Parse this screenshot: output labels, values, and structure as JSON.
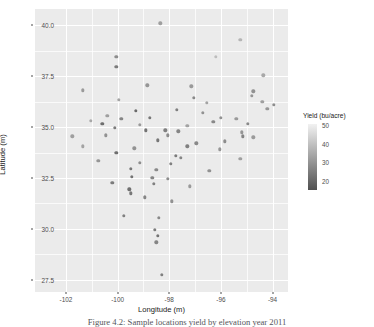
{
  "chart_data": {
    "type": "scatter",
    "title": "",
    "xlabel": "Longitude (m)",
    "ylabel": "Latitude (m)",
    "xlim": [
      -103.2,
      -93.4
    ],
    "ylim": [
      26.9,
      40.8
    ],
    "xticks": [
      -102,
      -100,
      -98,
      -96,
      -94
    ],
    "xtick_labels": [
      "-102",
      "-100",
      "-98",
      "-96",
      "-94"
    ],
    "yticks": [
      27.5,
      30.0,
      32.5,
      35.0,
      37.5,
      40.0
    ],
    "ytick_labels": [
      "27.5",
      "30.0",
      "32.5",
      "35.0",
      "37.5",
      "40.0"
    ],
    "x_minor_ticks": [
      -101,
      -99,
      -97,
      -95
    ],
    "y_minor_ticks": [
      28.75,
      31.25,
      33.75,
      36.25,
      38.75
    ],
    "grid": true,
    "panel_background": "#ebebeb",
    "grid_color": "#ffffff",
    "legend": {
      "title": "Yield (bu/acre)",
      "position": "right",
      "type": "continuous-colorbar",
      "ticks": [
        50,
        40,
        30,
        20
      ],
      "tick_labels": [
        "50",
        "40",
        "30",
        "20"
      ],
      "range": [
        15,
        52
      ],
      "color_low": "#505050",
      "color_high": "#f2f2f2"
    },
    "color_variable": "Yield (bu/acre)",
    "points": [
      {
        "x": -98.35,
        "y": 40.1,
        "v": 33
      },
      {
        "x": -95.25,
        "y": 39.3,
        "v": 38
      },
      {
        "x": -100.05,
        "y": 38.45,
        "v": 29
      },
      {
        "x": -96.2,
        "y": 38.45,
        "v": 40
      },
      {
        "x": -100.05,
        "y": 37.95,
        "v": 25
      },
      {
        "x": -94.35,
        "y": 37.55,
        "v": 35
      },
      {
        "x": -98.85,
        "y": 37.05,
        "v": 31
      },
      {
        "x": -97.15,
        "y": 37.0,
        "v": 32
      },
      {
        "x": -101.35,
        "y": 36.8,
        "v": 32
      },
      {
        "x": -94.75,
        "y": 36.75,
        "v": 30
      },
      {
        "x": -94.8,
        "y": 36.55,
        "v": 31
      },
      {
        "x": -97.05,
        "y": 36.45,
        "v": 28
      },
      {
        "x": -99.95,
        "y": 36.35,
        "v": 34
      },
      {
        "x": -94.4,
        "y": 36.25,
        "v": 33
      },
      {
        "x": -93.95,
        "y": 36.1,
        "v": 29
      },
      {
        "x": -94.2,
        "y": 35.9,
        "v": 31
      },
      {
        "x": -97.7,
        "y": 35.85,
        "v": 26
      },
      {
        "x": -99.3,
        "y": 35.8,
        "v": 21
      },
      {
        "x": -96.7,
        "y": 35.7,
        "v": 30
      },
      {
        "x": -100.4,
        "y": 35.55,
        "v": 33
      },
      {
        "x": -99.85,
        "y": 35.4,
        "v": 27
      },
      {
        "x": -98.75,
        "y": 35.45,
        "v": 24
      },
      {
        "x": -96.0,
        "y": 35.45,
        "v": 30
      },
      {
        "x": -95.4,
        "y": 35.4,
        "v": 32
      },
      {
        "x": -96.3,
        "y": 35.25,
        "v": 28
      },
      {
        "x": -100.6,
        "y": 35.15,
        "v": 22
      },
      {
        "x": -99.15,
        "y": 35.1,
        "v": 32
      },
      {
        "x": -97.3,
        "y": 35.05,
        "v": 34
      },
      {
        "x": -100.1,
        "y": 34.95,
        "v": 25
      },
      {
        "x": -98.9,
        "y": 34.85,
        "v": 23
      },
      {
        "x": -98.15,
        "y": 34.85,
        "v": 26
      },
      {
        "x": -97.65,
        "y": 34.8,
        "v": 27
      },
      {
        "x": -95.2,
        "y": 34.75,
        "v": 31
      },
      {
        "x": -101.75,
        "y": 34.55,
        "v": 33
      },
      {
        "x": -100.45,
        "y": 34.6,
        "v": 30
      },
      {
        "x": -98.05,
        "y": 34.6,
        "v": 29
      },
      {
        "x": -95.15,
        "y": 34.55,
        "v": 27
      },
      {
        "x": -94.75,
        "y": 34.5,
        "v": 32
      },
      {
        "x": -98.45,
        "y": 34.35,
        "v": 24
      },
      {
        "x": -96.95,
        "y": 34.2,
        "v": 28
      },
      {
        "x": -101.35,
        "y": 34.05,
        "v": 34
      },
      {
        "x": -97.3,
        "y": 34.05,
        "v": 26
      },
      {
        "x": -99.35,
        "y": 33.95,
        "v": 30
      },
      {
        "x": -96.05,
        "y": 33.9,
        "v": 31
      },
      {
        "x": -100.05,
        "y": 33.75,
        "v": 22
      },
      {
        "x": -97.75,
        "y": 33.6,
        "v": 25
      },
      {
        "x": -97.55,
        "y": 33.5,
        "v": 27
      },
      {
        "x": -95.25,
        "y": 33.45,
        "v": 33
      },
      {
        "x": -99.15,
        "y": 33.25,
        "v": 29
      },
      {
        "x": -97.95,
        "y": 33.2,
        "v": 26
      },
      {
        "x": -99.5,
        "y": 32.95,
        "v": 24
      },
      {
        "x": -98.5,
        "y": 32.9,
        "v": 28
      },
      {
        "x": -96.45,
        "y": 32.85,
        "v": 30
      },
      {
        "x": -99.45,
        "y": 32.55,
        "v": 23
      },
      {
        "x": -98.65,
        "y": 32.5,
        "v": 27
      },
      {
        "x": -98.05,
        "y": 32.45,
        "v": 29
      },
      {
        "x": -100.2,
        "y": 32.25,
        "v": 25
      },
      {
        "x": -98.6,
        "y": 32.2,
        "v": 26
      },
      {
        "x": -99.55,
        "y": 31.95,
        "v": 22
      },
      {
        "x": -99.5,
        "y": 31.75,
        "v": 24
      },
      {
        "x": -98.95,
        "y": 31.55,
        "v": 27
      },
      {
        "x": -97.9,
        "y": 31.35,
        "v": 30
      },
      {
        "x": -99.75,
        "y": 30.65,
        "v": 26
      },
      {
        "x": -98.4,
        "y": 30.55,
        "v": 28
      },
      {
        "x": -98.55,
        "y": 29.95,
        "v": 25
      },
      {
        "x": -98.45,
        "y": 29.65,
        "v": 23
      },
      {
        "x": -98.5,
        "y": 29.35,
        "v": 27
      },
      {
        "x": -98.3,
        "y": 27.75,
        "v": 26
      },
      {
        "x": -101.05,
        "y": 35.3,
        "v": 35
      },
      {
        "x": -96.55,
        "y": 36.2,
        "v": 34
      },
      {
        "x": -95.85,
        "y": 34.3,
        "v": 29
      },
      {
        "x": -100.75,
        "y": 33.35,
        "v": 31
      },
      {
        "x": -97.2,
        "y": 32.1,
        "v": 32
      },
      {
        "x": -94.95,
        "y": 35.15,
        "v": 28
      }
    ]
  },
  "caption": {
    "text": "Figure 4.2: Sample locations yield by elevation year 2011"
  }
}
